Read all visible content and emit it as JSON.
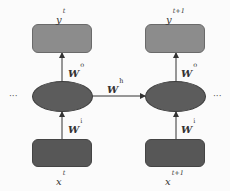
{
  "diagram": {
    "title": "",
    "colors": {
      "output_box": "#8c8c8c",
      "hidden_node": "#5c5c5c",
      "input_box": "#575757",
      "arrow": "#333333",
      "background": "#fbfbfb"
    },
    "timesteps": [
      {
        "output": {
          "base": "y",
          "sup": "t"
        },
        "input": {
          "base": "x",
          "sup": "t"
        },
        "w_out": {
          "base": "W",
          "sup": "o"
        },
        "w_in": {
          "base": "W",
          "sup": "i"
        }
      },
      {
        "output": {
          "base": "y",
          "sup": "t+1"
        },
        "input": {
          "base": "x",
          "sup": "t+1"
        },
        "w_out": {
          "base": "W",
          "sup": "o"
        },
        "w_in": {
          "base": "W",
          "sup": "i"
        }
      }
    ],
    "recurrent": {
      "base": "W",
      "sup": "h"
    },
    "ellipsis_left": "···",
    "ellipsis_right": "···"
  }
}
